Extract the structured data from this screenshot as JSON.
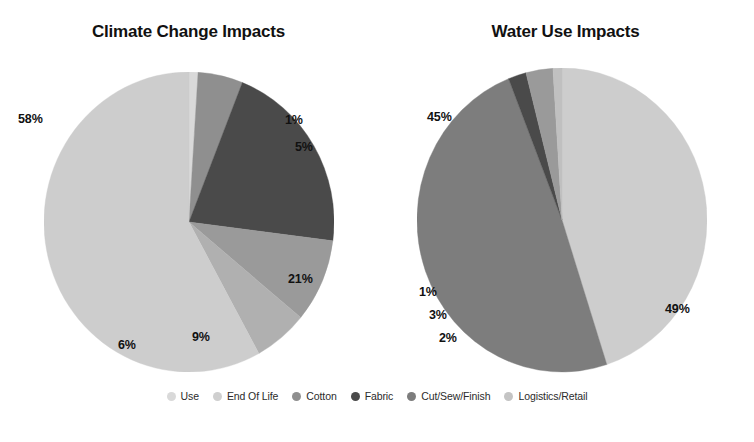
{
  "legend": {
    "position": "bottom",
    "items": [
      {
        "label": "Use",
        "color": "#d9d9d9"
      },
      {
        "label": "End Of Life",
        "color": "#cfcfcf"
      },
      {
        "label": "Cotton",
        "color": "#8f8f8f"
      },
      {
        "label": "Fabric",
        "color": "#4a4a4a"
      },
      {
        "label": "Cut/Sew/Finish",
        "color": "#7d7d7d"
      },
      {
        "label": "Logistics/Retail",
        "color": "#c4c4c4"
      }
    ]
  },
  "chart_data": [
    {
      "type": "pie",
      "title": "Climate Change Impacts",
      "xlabel": "",
      "ylabel": "",
      "categories": [
        "Use",
        "End Of Life",
        "Cotton",
        "Fabric",
        "Cut/Sew/Finish",
        "Logistics/Retail"
      ],
      "values": [
        1,
        5,
        21,
        9,
        6,
        58
      ],
      "value_labels": [
        "1%",
        "5%",
        "21%",
        "9%",
        "6%",
        "58%"
      ],
      "colors": [
        "#d9d9d9",
        "#8f8f8f",
        "#4a4a4a",
        "#9a9a9a",
        "#b0b0b0",
        "#cdcdcd"
      ],
      "start_angle_deg": 0,
      "direction": "clockwise",
      "grid": false
    },
    {
      "type": "pie",
      "title": "Water Use Impacts",
      "xlabel": "",
      "ylabel": "",
      "categories": [
        "Use",
        "Cut/Sew/Finish",
        "Fabric",
        "Cotton",
        "End Of Life"
      ],
      "values": [
        45,
        49,
        2,
        3,
        1
      ],
      "value_labels": [
        "45%",
        "49%",
        "2%",
        "3%",
        "1%"
      ],
      "colors": [
        "#cdcdcd",
        "#7d7d7d",
        "#4a4a4a",
        "#9a9a9a",
        "#c0c0c0"
      ],
      "start_angle_deg": 0,
      "direction": "clockwise",
      "grid": false
    }
  ],
  "labels_left": [
    {
      "text": "58%",
      "x": 18,
      "y": 112
    },
    {
      "text": "1%",
      "x": 285,
      "y": 113
    },
    {
      "text": "5%",
      "x": 295,
      "y": 140
    },
    {
      "text": "21%",
      "x": 288,
      "y": 272
    },
    {
      "text": "9%",
      "x": 192,
      "y": 330
    },
    {
      "text": "6%",
      "x": 118,
      "y": 338
    }
  ],
  "labels_right": [
    {
      "text": "45%",
      "x": 50,
      "y": 110
    },
    {
      "text": "49%",
      "x": 288,
      "y": 302
    },
    {
      "text": "1%",
      "x": 42,
      "y": 285
    },
    {
      "text": "3%",
      "x": 52,
      "y": 308
    },
    {
      "text": "2%",
      "x": 62,
      "y": 331
    }
  ]
}
